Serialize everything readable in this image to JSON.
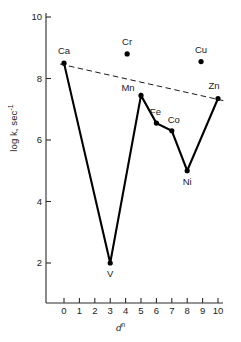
{
  "chart_data": {
    "type": "line",
    "title": "",
    "subtitle": "",
    "xlabel": "d",
    "xlabel_sup": "n",
    "ylabel": "log k, sec",
    "ylabel_sup": "-1",
    "xlim": [
      0,
      10
    ],
    "ylim": [
      0,
      10
    ],
    "x_ticks": [
      0,
      1,
      2,
      3,
      4,
      5,
      6,
      7,
      8,
      9,
      10
    ],
    "x_tick_labels": [
      "0",
      "1",
      "2",
      "3",
      "4",
      "5",
      "6",
      "7",
      "8",
      "9",
      "10"
    ],
    "y_ticks": [
      2,
      4,
      6,
      8,
      10
    ],
    "y_tick_labels": [
      "2",
      "4",
      "6",
      "8",
      "10"
    ],
    "y_minor_ticks": [],
    "grid": false,
    "legend": false,
    "axis_color": "#2b2b2b",
    "marker_color": "#000000",
    "line_color": "#000000",
    "series": [
      {
        "name": "connected-series",
        "style": "solid",
        "points": [
          {
            "label": "Ca",
            "x": 0,
            "y": 8.5,
            "label_dx": 0,
            "label_dy": -9
          },
          {
            "label": "V",
            "x": 3,
            "y": 2.0,
            "label_dx": 0,
            "label_dy": 14
          },
          {
            "label": "Mn",
            "x": 5,
            "y": 7.45,
            "label_dx": -13,
            "label_dy": -4
          },
          {
            "label": "Fe",
            "x": 6,
            "y": 6.55,
            "label_dx": -1,
            "label_dy": -8
          },
          {
            "label": "Co",
            "x": 7,
            "y": 6.3,
            "label_dx": 2,
            "label_dy": -8
          },
          {
            "label": "Ni",
            "x": 8,
            "y": 5.0,
            "label_dx": 0,
            "label_dy": 14
          },
          {
            "label": "Zn",
            "x": 10,
            "y": 7.35,
            "label_dx": -4,
            "label_dy": -9
          }
        ]
      },
      {
        "name": "isolated-points",
        "style": "none",
        "points": [
          {
            "label": "Cr",
            "x": 4.1,
            "y": 8.8,
            "label_dx": 0,
            "label_dy": -9
          },
          {
            "label": "Cu",
            "x": 8.9,
            "y": 8.55,
            "label_dx": 0,
            "label_dy": -9
          }
        ]
      },
      {
        "name": "baseline-trend",
        "style": "dashed",
        "points": [
          {
            "label": "",
            "x": -0.25,
            "y": 8.47
          },
          {
            "label": "",
            "x": 10.35,
            "y": 7.28
          }
        ]
      }
    ],
    "annotations": [
      "Ca",
      "V",
      "Mn",
      "Fe",
      "Co",
      "Ni",
      "Zn",
      "Cr",
      "Cu"
    ]
  }
}
